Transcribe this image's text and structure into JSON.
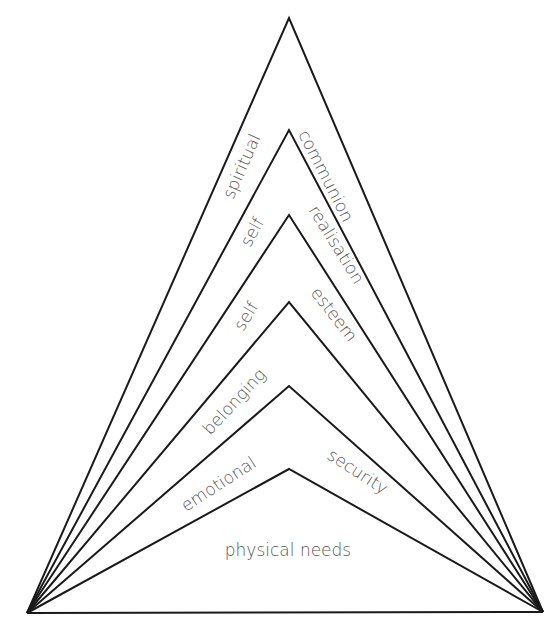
{
  "diagram": {
    "type": "nested-triangle-hierarchy",
    "colors": {
      "line": "#1a1a1a",
      "text": "#555555",
      "background": "#ffffff"
    },
    "levels": [
      {
        "left_label": "spiritual",
        "right_label": "communion"
      },
      {
        "left_label": "self",
        "right_label": "realisation"
      },
      {
        "left_label": "self",
        "right_label": "esteem"
      },
      {
        "left_label": "belonging",
        "right_label": ""
      },
      {
        "left_label": "emotional",
        "right_label": "security"
      },
      {
        "center_label": "physical needs"
      }
    ]
  }
}
